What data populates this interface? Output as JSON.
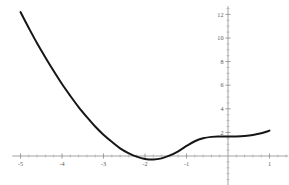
{
  "chart_data": {
    "type": "line",
    "title": "",
    "subtitle": "",
    "xlabel": "",
    "ylabel": "",
    "xlim": [
      -5.2,
      1.45
    ],
    "ylim": [
      -2.6,
      12.7
    ],
    "grid": false,
    "legend": null,
    "axis_color": "#8c8c8c",
    "curve_color": "#161616",
    "background_color": "#ffffff",
    "x_ticks_major": [
      -5,
      -4,
      -3,
      -2,
      -1,
      1
    ],
    "x_tick_labels": [
      "-5",
      "-4",
      "-3",
      "-2",
      "-1",
      "1"
    ],
    "x_ticks_minor": [
      -4.8,
      -4.6,
      -4.4,
      -4.2,
      -3.8,
      -3.6,
      -3.4,
      -3.2,
      -2.8,
      -2.6,
      -2.4,
      -2.2,
      -1.8,
      -1.6,
      -1.4,
      -1.2,
      -0.8,
      -0.6,
      -0.4,
      -0.2,
      0.2,
      0.4,
      0.6,
      0.8,
      1.2,
      1.4
    ],
    "y_ticks_major": [
      2,
      4,
      6,
      8,
      10,
      12
    ],
    "y_tick_labels": [
      "2",
      "4",
      "6",
      "8",
      "10",
      "12"
    ],
    "y_ticks_minor": [
      0.5,
      1,
      1.5,
      2.5,
      3,
      3.5,
      4.5,
      5,
      5.5,
      6.5,
      7,
      7.5,
      8.5,
      9,
      9.5,
      10.5,
      11,
      11.5,
      12.5,
      -0.5,
      -1,
      -1.5,
      -2,
      -2.5
    ],
    "series": [
      {
        "name": "curve",
        "x": [
          -5.0,
          -4.8,
          -4.6,
          -4.4,
          -4.2,
          -4.0,
          -3.8,
          -3.6,
          -3.4,
          -3.2,
          -3.0,
          -2.8,
          -2.6,
          -2.4,
          -2.2,
          -2.0,
          -1.8,
          -1.6,
          -1.4,
          -1.2,
          -1.0,
          -0.8,
          -0.6,
          -0.4,
          -0.2,
          0.0,
          0.2,
          0.4,
          0.6,
          0.8,
          1.0
        ],
        "y": [
          12.2,
          10.85,
          9.55,
          8.35,
          7.2,
          6.1,
          5.1,
          4.15,
          3.3,
          2.5,
          1.8,
          1.2,
          0.65,
          0.25,
          -0.05,
          -0.25,
          -0.3,
          -0.2,
          0.05,
          0.4,
          0.85,
          1.25,
          1.5,
          1.62,
          1.65,
          1.65,
          1.66,
          1.7,
          1.78,
          1.92,
          2.15
        ]
      }
    ],
    "notes": {
      "zero_crossings": [
        -3.08,
        -1.45
      ],
      "local_minimum": {
        "x": -1.85,
        "y": -0.3
      },
      "plateau_value": 1.65,
      "left_endpoint": {
        "x": -5,
        "y": 12.2
      },
      "right_endpoint": {
        "x": 1,
        "y": 2.15
      }
    }
  },
  "figure": {
    "caption": ""
  }
}
